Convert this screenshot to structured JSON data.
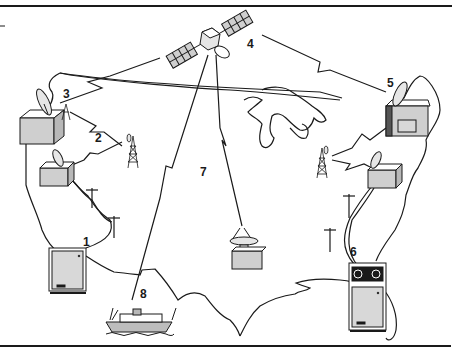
{
  "diagram": {
    "type": "communications-network-map",
    "colors": {
      "line": "#1a1a1a",
      "fill_gray": "#cfcfcf",
      "fill_light": "#e6e6e6",
      "background": "#ffffff"
    },
    "labels": [
      {
        "id": "1",
        "text": "1",
        "element": "computer-terminal-west"
      },
      {
        "id": "2",
        "text": "2",
        "element": "microwave-relay-west"
      },
      {
        "id": "3",
        "text": "3",
        "element": "earth-station-west-uplink"
      },
      {
        "id": "4",
        "text": "4",
        "element": "communications-satellite"
      },
      {
        "id": "5",
        "text": "5",
        "element": "earth-station-east"
      },
      {
        "id": "6",
        "text": "6",
        "element": "computer-with-tape-drive-east"
      },
      {
        "id": "7",
        "text": "7",
        "element": "satellite-downlink-central"
      },
      {
        "id": "8",
        "text": "8",
        "element": "ship"
      }
    ]
  }
}
